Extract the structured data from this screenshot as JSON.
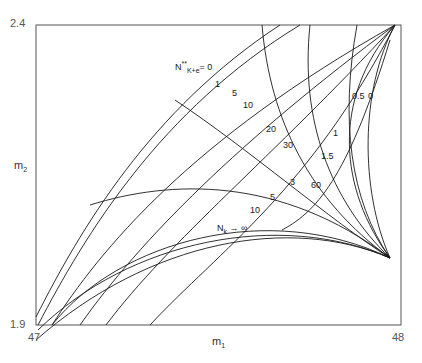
{
  "diagram": {
    "type": "line-family-plot",
    "x_axis": {
      "label": "m",
      "label_sub": "1",
      "min": "47",
      "max": "48"
    },
    "y_axis": {
      "label": "m",
      "label_sub": "2",
      "min": "1.9",
      "max": "2.4"
    },
    "family_upper": {
      "label_base": "N",
      "label_sup": "**",
      "label_sub": "K+e",
      "label_eq": "= 0",
      "values": [
        "1",
        "5",
        "10",
        "20",
        "30",
        "60"
      ]
    },
    "family_lower": {
      "values": [
        "5",
        "10"
      ],
      "limit_label_base": "N",
      "limit_label_sub": "k",
      "limit_label_arrow": "→ ∞"
    },
    "family_right": {
      "values": [
        "0",
        "0.5",
        "1",
        "1.5",
        "3"
      ]
    }
  }
}
